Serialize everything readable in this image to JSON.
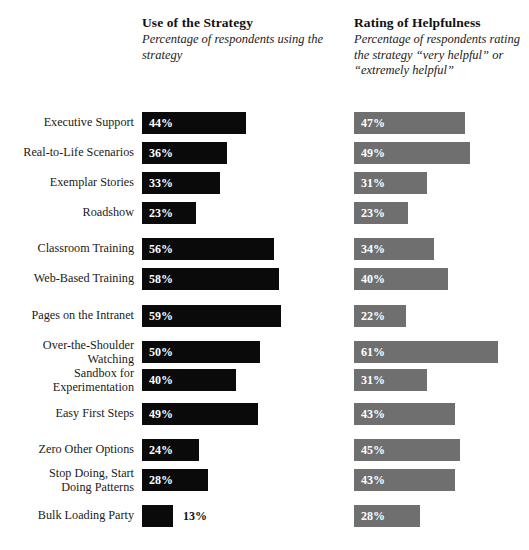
{
  "headers": {
    "use": {
      "title": "Use of the Strategy",
      "subtitle": "Percentage of respondents\nusing the strategy"
    },
    "rating": {
      "title": "Rating of Helpfulness",
      "subtitle": "Percentage of respondents\nrating the strategy “very\nhelpful” or “extremely helpful”"
    }
  },
  "colors": {
    "use_bar": "#0a0a0a",
    "rating_bar": "#6f6f6f",
    "value_text_inside": "#ffffff",
    "value_text_outside": "#111111",
    "background": "#ffffff",
    "label_text": "#1a1a1a"
  },
  "chart_data": {
    "type": "bar",
    "title": "",
    "orientation": "horizontal",
    "grid": false,
    "legend": "none",
    "xlabel": "",
    "ylabel": "",
    "xlim": [
      0,
      70
    ],
    "value_suffix": "%",
    "categories": [
      "Executive Support",
      "Real-to-Life Scenarios",
      "Exemplar Stories",
      "Roadshow",
      "Classroom Training",
      "Web-Based Training",
      "Pages on the Intranet",
      "Over-the-Shoulder\nWatching",
      "Sandbox for\nExperimentation",
      "Easy First Steps",
      "Zero Other Options",
      "Stop Doing, Start\nDoing Patterns",
      "Bulk Loading Party"
    ],
    "series": [
      {
        "name": "Use of the Strategy",
        "color": "#0a0a0a",
        "values": [
          44,
          36,
          33,
          23,
          56,
          58,
          59,
          50,
          40,
          49,
          24,
          28,
          13
        ],
        "labels": [
          "44%",
          "36%",
          "33%",
          "23%",
          "56%",
          "58%",
          "59%",
          "50%",
          "40%",
          "49%",
          "24%",
          "28%",
          "13%"
        ]
      },
      {
        "name": "Rating of Helpfulness",
        "color": "#6f6f6f",
        "values": [
          47,
          49,
          31,
          23,
          34,
          40,
          22,
          61,
          31,
          43,
          45,
          43,
          28
        ],
        "labels": [
          "47%",
          "49%",
          "31%",
          "23%",
          "34%",
          "40%",
          "22%",
          "61%",
          "31%",
          "43%",
          "45%",
          "43%",
          "28%"
        ]
      }
    ]
  },
  "layout": {
    "row_tops": [
      4,
      34,
      64,
      94,
      130,
      160,
      197,
      233,
      261,
      295,
      331,
      361,
      397
    ],
    "px_per_percent": 2.36,
    "bar_height": 22
  }
}
